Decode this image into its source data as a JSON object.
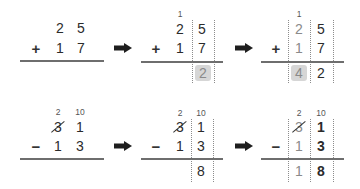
{
  "diagram": {
    "colors": {
      "text_dark": "#2b2b2b",
      "text_gray": "#8a8a8a",
      "highlight": "#d6d6d6",
      "rule": "#6e6e6e"
    },
    "arrow_icon": "right-arrow",
    "addition": {
      "operator": "+",
      "steps": [
        {
          "top": [
            "2",
            "5"
          ],
          "bottom": [
            "1",
            "7"
          ],
          "carry": "",
          "result": [
            "",
            ""
          ]
        },
        {
          "top": [
            "2",
            "5"
          ],
          "bottom": [
            "1",
            "7"
          ],
          "carry": "1",
          "result": [
            "",
            "2"
          ],
          "highlight": "ones"
        },
        {
          "top": [
            "2",
            "5"
          ],
          "bottom": [
            "1",
            "7"
          ],
          "carry": "1",
          "result": [
            "4",
            "2"
          ],
          "highlight": "tens"
        }
      ]
    },
    "subtraction": {
      "operator": "−",
      "steps": [
        {
          "borrow_tens": "2",
          "borrow_ones": "10",
          "top": [
            "3",
            "1"
          ],
          "bottom": [
            "1",
            "3"
          ],
          "result": [
            "",
            ""
          ],
          "struck": "3"
        },
        {
          "borrow_tens": "2",
          "borrow_ones": "10",
          "top": [
            "3",
            "1"
          ],
          "bottom": [
            "1",
            "3"
          ],
          "result": [
            "",
            "8"
          ],
          "struck": "3"
        },
        {
          "borrow_tens": "2",
          "borrow_ones": "10",
          "top": [
            "3",
            "1"
          ],
          "bottom": [
            "1",
            "3"
          ],
          "result": [
            "1",
            "8"
          ],
          "struck": "3"
        }
      ]
    }
  }
}
